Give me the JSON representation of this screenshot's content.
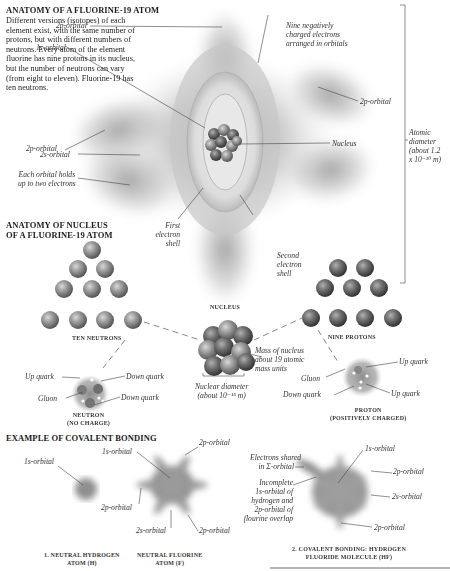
{
  "section1": {
    "title": "ANATOMY OF A FLUORINE-19 ATOM",
    "description": "Different versions (isotopes) of each element exist, with the same number of protons, but with different numbers of neutrons. Every atom of the element fluorine has nine protons in its nucleus, but the number of neutrons can vary (from eight to eleven). Fluorine-19 has ten neutrons.",
    "labels": {
      "orbital_2p_top": "2p-orbital",
      "orbital_1s": "1s-orbital",
      "nine_electrons": [
        "Nine negatively",
        "charged electrons",
        "arranged in orbitals"
      ],
      "orbital_2p_right": "2p-orbital",
      "orbital_2p_left": "2p-orbital",
      "orbital_2s": "2s-orbital",
      "nucleus": "Nucleus",
      "each_orbital": [
        "Each orbital holds",
        "up to two electrons"
      ],
      "atomic_diameter": [
        "Atomic",
        "diameter",
        "(about 1.2",
        "x 10⁻¹⁰ m)"
      ],
      "first_shell": [
        "First",
        "electron",
        "shell"
      ],
      "second_shell": [
        "Second",
        "electron",
        "shell"
      ]
    }
  },
  "section2": {
    "title_lines": [
      "ANATOMY OF NUCLEUS",
      "OF A FLUORINE-19 ATOM"
    ],
    "ten_neutrons": "TEN NEUTRONS",
    "nine_protons": "NINE PROTONS",
    "nucleus": "NUCLEUS",
    "mass": [
      "Mass of nucleus",
      "about 19 atomic",
      "mass units"
    ],
    "nuclear_diameter": [
      "Nuclear diameter",
      "(about 10⁻¹⁵ m)"
    ],
    "neutron": {
      "up_quark": "Up quark",
      "down_quark_1": "Down quark",
      "down_quark_2": "Down quark",
      "gluon": "Gluon",
      "caption": [
        "NEUTRON",
        "(NO CHARGE)"
      ]
    },
    "proton": {
      "up_quark_1": "Up quark",
      "up_quark_2": "Up quark",
      "gluon": "Gluon",
      "down_quark": "Down quark",
      "caption": [
        "PROTON",
        "(POSITIVELY CHARGED)"
      ]
    }
  },
  "section3": {
    "title": "EXAMPLE OF COVALENT BONDING",
    "hydrogen": {
      "orbital_1s": "1s-orbital",
      "caption": [
        "1. NEUTRAL HYDROGEN",
        "ATOM (H)"
      ]
    },
    "fluorine": {
      "orbital_1s": "1s-orbital",
      "orbital_2p_top": "2p-orbital",
      "orbital_2p_left": "2p-orbital",
      "orbital_2s": "2s-orbital",
      "orbital_2p_bottom": "2p-orbital",
      "caption": [
        "NEUTRAL FLUORINE",
        "ATOM (F)"
      ]
    },
    "hf": {
      "electrons_shared": [
        "Electrons shared",
        "in Σ-orbital"
      ],
      "incomplete": [
        "Incomplete",
        "1s-orbital of",
        "hydrogen and",
        "2p-orbital of",
        "flourine overlap"
      ],
      "orbital_1s": "1s-orbital",
      "orbital_2p_1": "2p-orbital",
      "orbital_2s": "2s-orbital",
      "orbital_2p_2": "2p-orbital",
      "caption": [
        "2. COVALENT BONDING: HYDROGEN",
        "FLUORIDE MOLECULE (HF)"
      ]
    }
  }
}
